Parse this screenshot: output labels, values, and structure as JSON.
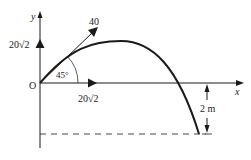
{
  "diagram": {
    "type": "projectile-motion",
    "axes": {
      "x_label": "x",
      "y_label": "y",
      "origin_label": "O"
    },
    "initial_velocity": {
      "magnitude_label": "40",
      "angle_label": "45°"
    },
    "components": {
      "vertical_label": "20√2",
      "horizontal_label": "20√2"
    },
    "drop": {
      "height_label": "2 m"
    },
    "colors": {
      "ink": "#1a1a1a",
      "background": "#ffffff"
    }
  }
}
